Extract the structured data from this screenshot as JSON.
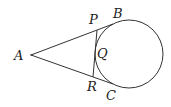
{
  "diagram": {
    "type": "geometry",
    "points": {
      "A": {
        "label": "A",
        "x": 31,
        "y": 55
      },
      "B": {
        "label": "B",
        "x": 113,
        "y": 24
      },
      "C": {
        "label": "C",
        "x": 113,
        "y": 84
      },
      "P": {
        "label": "P",
        "x": 97,
        "y": 30
      },
      "Q": {
        "label": "Q",
        "x": 95,
        "y": 54
      },
      "R": {
        "label": "R",
        "x": 93,
        "y": 77
      }
    },
    "circle": {
      "cx": 129,
      "cy": 54,
      "r": 34
    },
    "labels": {
      "A": "A",
      "B": "B",
      "C": "C",
      "P": "P",
      "Q": "Q",
      "R": "R"
    },
    "colors": {
      "stroke": "#333333",
      "text": "#222222",
      "background": "#ffffff"
    }
  }
}
